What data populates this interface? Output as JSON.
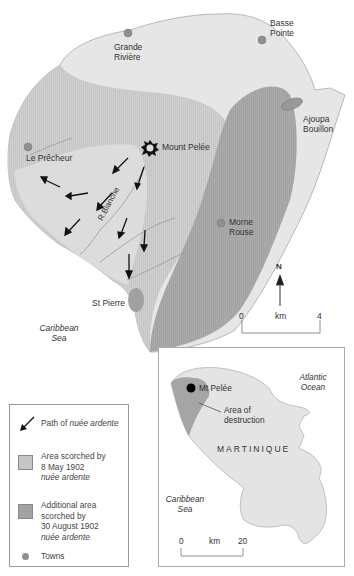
{
  "main_map": {
    "towns": [
      {
        "name": "Grande\nRivière",
        "line1": "Grande",
        "line2": "Rivière"
      },
      {
        "name": "Basse Pointe",
        "line1": "Basse",
        "line2": "Pointe"
      },
      {
        "name": "Ajoupa Bouillon",
        "line1": "Ajoupa",
        "line2": "Bouillon"
      },
      {
        "name": "Le Prêcheur",
        "line1": "Le Prêcheur"
      },
      {
        "name": "Morne Rouse",
        "line1": "Morne",
        "line2": "Rouse"
      },
      {
        "name": "St Pierre",
        "line1": "St Pierre"
      }
    ],
    "volcano_label": "Mount Pelée",
    "river_label": "R.Blanche",
    "sea_label_1": "Caribbean",
    "sea_label_2": "Sea",
    "north_label": "N",
    "scale": {
      "start": "0",
      "unit": "km",
      "end": "4"
    }
  },
  "colors": {
    "land": "#e6e6e6",
    "scorched_may": "#c9c9c9",
    "scorched_august": "#a3a3a3",
    "path_area": "#dadada",
    "town": "#8f8f8f",
    "coast": "#999999"
  },
  "legend": {
    "items": [
      {
        "icon": "arrow-icon",
        "text": "Path of ",
        "text_italic": "nuée ardente"
      },
      {
        "icon": "swatch-light",
        "line1": "Area scorched by",
        "line2": "8 May 1902",
        "line3": "nuée ardente"
      },
      {
        "icon": "swatch-dark",
        "line1": "Additional area",
        "line2": "scorched by",
        "line3": "30 August 1902",
        "line4": "nuée ardente"
      },
      {
        "icon": "town-dot-icon",
        "text": "Towns"
      }
    ]
  },
  "inset": {
    "ocean_label_1": "Atlantic",
    "ocean_label_2": "Ocean",
    "volcano_label": "Mt Pelée",
    "destruction_label_1": "Area of",
    "destruction_label_2": "destruction",
    "island_label": "MARTINIQUE",
    "sea_label_1": "Caribbean",
    "sea_label_2": "Sea",
    "scale": {
      "start": "0",
      "unit": "km",
      "end": "20"
    }
  }
}
